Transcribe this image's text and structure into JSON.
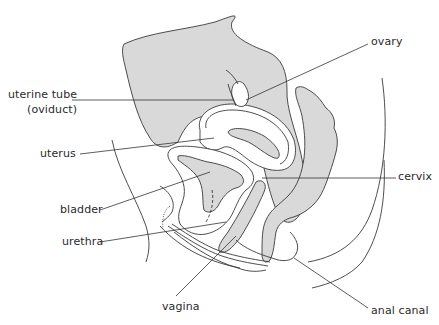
{
  "figure": {
    "type": "anatomical-diagram",
    "colors": {
      "tissue_fill": "#d9d9d9",
      "line": "#3a3a3a",
      "background": "#ffffff",
      "text": "#2a2a2a"
    },
    "labels": [
      {
        "id": "ovary",
        "text": "ovary",
        "x": 371,
        "y": 36
      },
      {
        "id": "uterine-tube",
        "text": "uterine tube",
        "x": 8,
        "y": 89
      },
      {
        "id": "oviduct",
        "text": "(oviduct)",
        "x": 27,
        "y": 104
      },
      {
        "id": "uterus",
        "text": "uterus",
        "x": 40,
        "y": 147
      },
      {
        "id": "cervix",
        "text": "cervix",
        "x": 398,
        "y": 171
      },
      {
        "id": "bladder",
        "text": "bladder",
        "x": 60,
        "y": 203
      },
      {
        "id": "urethra",
        "text": "urethra",
        "x": 62,
        "y": 235
      },
      {
        "id": "vagina",
        "text": "vagina",
        "x": 162,
        "y": 300
      },
      {
        "id": "anal-canal",
        "text": "anal canal",
        "x": 371,
        "y": 305
      }
    ]
  }
}
